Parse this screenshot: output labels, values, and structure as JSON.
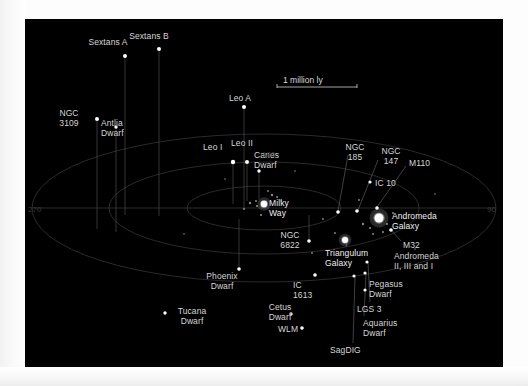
{
  "figure": {
    "background_color": "#000000",
    "page_color": "#ffffff",
    "label_color": "#d6d6d6",
    "ring_color": "#3c3c3c",
    "star_color": "#ffffff"
  },
  "scale": {
    "label": "1 million ly",
    "x": 258,
    "y": 56,
    "bar_x1": 252,
    "bar_x2": 332,
    "bar_y": 68
  },
  "degree_markers": [
    {
      "label": "270",
      "x": 3,
      "y": 186
    },
    {
      "label": "180",
      "x": 237,
      "y": 131
    },
    {
      "label": "90",
      "x": 462,
      "y": 186
    }
  ],
  "rings": [
    {
      "name": "outer-ring",
      "cx": 239,
      "cy": 189,
      "rx": 232,
      "ry": 74
    },
    {
      "name": "middle-ring",
      "cx": 239,
      "cy": 189,
      "rx": 155,
      "ry": 46
    },
    {
      "name": "inner-ring",
      "cx": 239,
      "cy": 189,
      "rx": 77,
      "ry": 22
    },
    {
      "name": "midplane-line",
      "x1": 7,
      "y1": 189,
      "x2": 471,
      "y2": 189
    }
  ],
  "objects": [
    {
      "name": "Sextans A",
      "label": "Sextans A",
      "lx": 68,
      "ly": 19,
      "align": "center",
      "px": 100,
      "py": 37,
      "stem_to": 196,
      "size": 2.0
    },
    {
      "name": "Sextans B",
      "label": "Sextans B",
      "lx": 109,
      "ly": 13,
      "align": "center",
      "px": 134,
      "py": 30,
      "stem_to": 197,
      "size": 2.0
    },
    {
      "name": "NGC 3109",
      "label": "NGC\n3109",
      "lx": 29,
      "ly": 90,
      "align": "center",
      "px": 72,
      "py": 100,
      "stem_to": 210,
      "size": 2.0
    },
    {
      "name": "Antlia Dwarf",
      "label": "Antlia\nDwarf",
      "lx": 76,
      "ly": 100,
      "align": "left",
      "px": 91,
      "py": 108,
      "stem_to": 213,
      "size": 1.7
    },
    {
      "name": "Leo A",
      "label": "Leo A",
      "lx": 200,
      "ly": 75,
      "align": "center",
      "px": 219,
      "py": 88,
      "stem_to": 190,
      "size": 2.0
    },
    {
      "name": "Leo I",
      "label": "Leo I",
      "lx": 178,
      "ly": 124,
      "align": "left",
      "px": 208,
      "py": 143,
      "stem_to": 185,
      "size": 2.2
    },
    {
      "name": "Leo II",
      "label": "Leo II",
      "lx": 206,
      "ly": 120,
      "align": "left",
      "px": 222,
      "py": 143,
      "stem_to": 182,
      "size": 2.0
    },
    {
      "name": "Canes Dwarf",
      "label": "Canes\nDwarf",
      "lx": 229,
      "ly": 132,
      "align": "left",
      "px": 234,
      "py": 152,
      "stem_to": 180,
      "size": 1.7
    },
    {
      "name": "Milky Way",
      "label": "Milky\nWay",
      "lx": 244,
      "ly": 180,
      "align": "left",
      "px": 239,
      "py": 185,
      "stem_to": null,
      "size": 3.2
    },
    {
      "name": "NGC 6822",
      "label": "NGC\n6822",
      "lx": 250,
      "ly": 212,
      "align": "center",
      "px": 284,
      "py": 222,
      "stem_to": 196,
      "size": 1.8
    },
    {
      "name": "NGC 185",
      "label": "NGC\n185",
      "lx": 315,
      "ly": 124,
      "align": "center",
      "px": 313,
      "py": 193,
      "stem_to": null,
      "size": 1.8
    },
    {
      "name": "NGC 147",
      "label": "NGC\n147",
      "lx": 351,
      "ly": 128,
      "align": "center",
      "px": 332,
      "py": 192,
      "stem_to": null,
      "size": 1.8
    },
    {
      "name": "M110",
      "label": "M110",
      "lx": 384,
      "ly": 140,
      "align": "left",
      "px": 352,
      "py": 189,
      "stem_to": null,
      "size": 1.8
    },
    {
      "name": "IC 10",
      "label": "IC 10",
      "lx": 350,
      "ly": 160,
      "align": "left",
      "px": 345,
      "py": 163,
      "stem_to": null,
      "size": 1.6
    },
    {
      "name": "Andromeda Galaxy",
      "label": "Andromeda\nGalaxy",
      "lx": 367,
      "ly": 193,
      "align": "left",
      "px": 354,
      "py": 199,
      "stem_to": null,
      "size": 4.5
    },
    {
      "name": "M32",
      "label": "M32",
      "lx": 378,
      "ly": 222,
      "align": "left",
      "px": 366,
      "py": 211,
      "stem_to": null,
      "size": 1.8
    },
    {
      "name": "Triangulum Galaxy",
      "label": "Triangulum\nGalaxy",
      "lx": 300,
      "ly": 230,
      "align": "left",
      "px": 320,
      "py": 221,
      "stem_to": null,
      "size": 3.0
    },
    {
      "name": "Andromeda II, III and I",
      "label": "Andromeda\nII, III and I",
      "lx": 369,
      "ly": 233,
      "align": "left",
      "px": null,
      "py": null,
      "stem_to": null,
      "size": 0
    },
    {
      "name": "Phoenix Dwarf",
      "label": "Phoenix\nDwarf",
      "lx": 182,
      "ly": 253,
      "align": "center",
      "px": 214,
      "py": 250,
      "stem_to": 200,
      "size": 1.8
    },
    {
      "name": "Tucana Dwarf",
      "label": "Tucana\nDwarf",
      "lx": 152,
      "ly": 288,
      "align": "center",
      "px": 140,
      "py": 294,
      "stem_to": null,
      "size": 1.7
    },
    {
      "name": "Cetus Dwarf",
      "label": "Cetus\nDwarf",
      "lx": 240,
      "ly": 284,
      "align": "center",
      "px": 266,
      "py": 295,
      "stem_to": null,
      "size": 1.7
    },
    {
      "name": "IC 1613",
      "label": "IC\n1613",
      "lx": 268,
      "ly": 262,
      "align": "left",
      "px": 290,
      "py": 256,
      "stem_to": null,
      "size": 1.8
    },
    {
      "name": "WLM",
      "label": "WLM",
      "lx": 253,
      "ly": 306,
      "align": "left",
      "px": 277,
      "py": 309,
      "stem_to": null,
      "size": 1.8
    },
    {
      "name": "SagDIG",
      "label": "SagDIG",
      "lx": 305,
      "ly": 327,
      "align": "left",
      "px": 329,
      "py": 257,
      "stem_to": null,
      "size": 1.6
    },
    {
      "name": "Aquarius Dwarf",
      "label": "Aquarius\nDwarf",
      "lx": 338,
      "ly": 300,
      "align": "left",
      "px": 340,
      "py": 254,
      "stem_to": null,
      "size": 1.6
    },
    {
      "name": "LGS 3",
      "label": "LGS 3",
      "lx": 332,
      "ly": 286,
      "align": "left",
      "px": 342,
      "py": 243,
      "stem_to": null,
      "size": 1.6
    },
    {
      "name": "Pegasus Dwarf",
      "label": "Pegasus\nDwarf",
      "lx": 344,
      "ly": 261,
      "align": "left",
      "px": 340,
      "py": 271,
      "stem_to": null,
      "size": 1.6
    }
  ],
  "leader_lines": [
    {
      "name": "ngc185-leader",
      "x1": 323,
      "y1": 136,
      "x2": 313,
      "y2": 192
    },
    {
      "name": "ngc147-leader",
      "x1": 353,
      "y1": 141,
      "x2": 333,
      "y2": 191
    },
    {
      "name": "m110-leader",
      "x1": 381,
      "y1": 147,
      "x2": 352,
      "y2": 188
    },
    {
      "name": "sagdig-leader",
      "x1": 328,
      "y1": 324,
      "x2": 330,
      "y2": 258
    },
    {
      "name": "aquarius-leader",
      "x1": 339,
      "y1": 297,
      "x2": 341,
      "y2": 255
    },
    {
      "name": "lgs3-leader",
      "x1": 345,
      "y1": 283,
      "x2": 343,
      "y2": 244
    },
    {
      "name": "triangulum-leader",
      "x1": 321,
      "y1": 228,
      "x2": 322,
      "y2": 222
    },
    {
      "name": "m32-leader",
      "x1": 376,
      "y1": 222,
      "x2": 367,
      "y2": 212
    }
  ],
  "field_stars": [
    {
      "x": 225,
      "y": 184,
      "s": 1.2
    },
    {
      "x": 231,
      "y": 182,
      "s": 1.0
    },
    {
      "x": 232,
      "y": 187,
      "s": 1.1
    },
    {
      "x": 247,
      "y": 176,
      "s": 1.2
    },
    {
      "x": 252,
      "y": 178,
      "s": 1.0
    },
    {
      "x": 236,
      "y": 196,
      "s": 1.1
    },
    {
      "x": 219,
      "y": 190,
      "s": 1.0
    },
    {
      "x": 256,
      "y": 182,
      "s": 0.9
    },
    {
      "x": 243,
      "y": 172,
      "s": 0.9
    },
    {
      "x": 338,
      "y": 205,
      "s": 1.2
    },
    {
      "x": 345,
      "y": 209,
      "s": 1.1
    },
    {
      "x": 362,
      "y": 205,
      "s": 1.1
    },
    {
      "x": 348,
      "y": 215,
      "s": 1.0
    },
    {
      "x": 358,
      "y": 213,
      "s": 1.0
    },
    {
      "x": 334,
      "y": 181,
      "s": 0.9
    },
    {
      "x": 368,
      "y": 194,
      "s": 1.0
    },
    {
      "x": 298,
      "y": 200,
      "s": 0.9
    },
    {
      "x": 310,
      "y": 214,
      "s": 0.9
    },
    {
      "x": 287,
      "y": 234,
      "s": 0.9
    },
    {
      "x": 200,
      "y": 160,
      "s": 0.8
    },
    {
      "x": 159,
      "y": 215,
      "s": 0.8
    },
    {
      "x": 410,
      "y": 175,
      "s": 0.8
    },
    {
      "x": 390,
      "y": 230,
      "s": 0.8
    },
    {
      "x": 270,
      "y": 152,
      "s": 0.8
    }
  ]
}
